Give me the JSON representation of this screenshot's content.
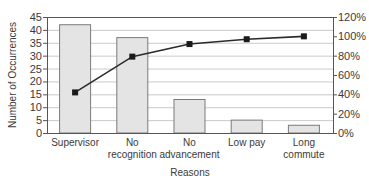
{
  "chart_data": {
    "type": "bar",
    "title": "",
    "xlabel": "Reasons",
    "ylabel": "Number of Occurrences",
    "y2label": "",
    "categories": [
      "Supervisor",
      "No recognition",
      "No advancement",
      "Low pay",
      "Long commute"
    ],
    "category_lines": [
      [
        "Supervisor"
      ],
      [
        "No",
        "recognition"
      ],
      [
        "No",
        "advancement"
      ],
      [
        "Low pay"
      ],
      [
        "Long",
        "commute"
      ]
    ],
    "series": [
      {
        "name": "Number of Occurrences",
        "type": "bar",
        "axis": "left",
        "values": [
          42,
          37,
          13,
          5,
          3
        ]
      },
      {
        "name": "Cumulative Percentage",
        "type": "line",
        "axis": "right",
        "values": [
          42,
          79,
          92,
          97,
          100
        ]
      }
    ],
    "ylim": [
      0,
      45
    ],
    "y_ticks": [
      0,
      5,
      10,
      15,
      20,
      25,
      30,
      35,
      40,
      45
    ],
    "y2lim": [
      0,
      120
    ],
    "y2_ticks": [
      "0%",
      "20%",
      "40%",
      "60%",
      "80%",
      "100%",
      "120%"
    ],
    "grid": true,
    "legend": "none"
  },
  "colors": {
    "bar_fill": "#e4e4e4",
    "bar_stroke": "#7a7a7a",
    "line": "#2a2a2a",
    "marker": "#1a1a1a",
    "grid": "#bdbdbd",
    "axis": "#555555"
  }
}
